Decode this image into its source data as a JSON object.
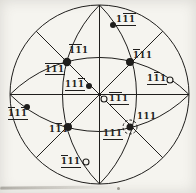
{
  "figure": {
    "ink": "#1f1e1c",
    "paper": "#f5f4ef",
    "projection": {
      "cx": 99.5,
      "cy": 94.5,
      "radius": 89.5,
      "great_circle_arc_radius": 126.7
    },
    "poles": [
      {
        "id": "matrix-m1m11",
        "reading": "1̄1̄1",
        "text": "111",
        "bars": [
          0,
          1
        ],
        "underline": false,
        "marker": "filled",
        "marker_r": 4.2,
        "x": 67,
        "y": 62,
        "lx": 69,
        "ly": 44
      },
      {
        "id": "matrix-m111",
        "reading": "1̄11",
        "text": "111",
        "bars": [
          0
        ],
        "underline": false,
        "marker": "filled",
        "marker_r": 4,
        "x": 130,
        "y": 62,
        "lx": 133,
        "ly": 49
      },
      {
        "id": "matrix-1m11",
        "reading": "11̄1",
        "text": "111",
        "bars": [
          1
        ],
        "underline": false,
        "marker": "filled",
        "marker_r": 4,
        "x": 68,
        "y": 127,
        "lx": 49,
        "ly": 123
      },
      {
        "id": "matrix-111",
        "reading": "111",
        "text": "111",
        "bars": [],
        "underline": false,
        "marker": "filled",
        "marker_r": 3.5,
        "x": 130,
        "y": 127,
        "lx": 137,
        "ly": 110,
        "ring_r": 7
      },
      {
        "id": "twin-1m1m1",
        "reading": "11̄1̄",
        "text": "111",
        "bars": [
          1,
          2
        ],
        "underline": true,
        "marker": "filled",
        "marker_r": 3,
        "x": 113,
        "y": 25,
        "lx": 116,
        "ly": 13
      },
      {
        "id": "twin-m1m1m1",
        "reading": "1̄1̄1̄",
        "text": "111",
        "bars": [
          0,
          1,
          2
        ],
        "underline": true,
        "marker": "none",
        "x": 67,
        "y": 62,
        "lx": 45,
        "ly": 63
      },
      {
        "id": "twin-11m1",
        "reading": "111̄",
        "text": "111",
        "bars": [
          2
        ],
        "underline": true,
        "marker": "filled",
        "marker_r": 3,
        "x": 89,
        "y": 86,
        "lx": 65,
        "ly": 78
      },
      {
        "id": "twin-m1m11",
        "reading": "1̄1̄1",
        "text": "111",
        "bars": [
          0,
          1
        ],
        "underline": true,
        "marker": "open",
        "marker_r": 3,
        "x": 104,
        "y": 99,
        "lx": 109,
        "ly": 92
      },
      {
        "id": "twin-1m11",
        "reading": "11̄1",
        "text": "111",
        "bars": [
          1
        ],
        "underline": true,
        "marker": "open",
        "marker_r": 3,
        "x": 170,
        "y": 80,
        "lx": 147,
        "ly": 72
      },
      {
        "id": "twin-m11m1",
        "reading": "1̄11̄",
        "text": "111",
        "bars": [
          0,
          2
        ],
        "underline": true,
        "marker": "filled",
        "marker_r": 3,
        "x": 27,
        "y": 107,
        "lx": 8,
        "ly": 107
      },
      {
        "id": "twin-111",
        "reading": "111",
        "text": "111",
        "bars": [],
        "underline": true,
        "marker": "none",
        "x": 130,
        "y": 127,
        "lx": 103,
        "ly": 127
      },
      {
        "id": "twin-m111",
        "reading": "1̄11",
        "text": "111",
        "bars": [
          0
        ],
        "underline": true,
        "marker": "open",
        "marker_r": 3,
        "x": 86,
        "y": 162,
        "lx": 61,
        "ly": 155
      }
    ]
  }
}
